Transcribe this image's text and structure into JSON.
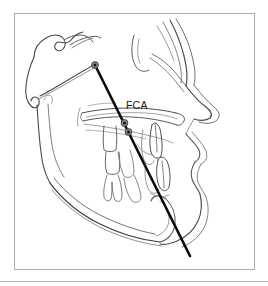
{
  "figure": {
    "domain": "cephalometric-tracing",
    "background_color": "#ffffff",
    "frame": {
      "name": "figure-border",
      "color": "#a9adb2",
      "x": 14,
      "y": 13,
      "width": 241,
      "height": 257
    },
    "bottom_rule": {
      "name": "bottom-divider",
      "color": "#b3b7bb",
      "y": 281
    }
  },
  "labels": [
    {
      "id": "fca",
      "text": "FCA",
      "x": 126,
      "y": 100,
      "color": "#1a1a1a",
      "font_size": 10.5
    }
  ],
  "measurement_line": {
    "name": "fca-line",
    "color": "#0b0b0b",
    "stroke_width": 2.6,
    "start": {
      "x": 95,
      "y": 65
    },
    "end": {
      "x": 190,
      "y": 256
    }
  },
  "landmark_points": [
    {
      "id": "point-superior",
      "x": 95,
      "y": 65,
      "outer_color": "#8a8a8a",
      "inner_color": "#111111",
      "outer_r": 3.4,
      "inner_r": 1.5
    },
    {
      "id": "point-middle",
      "x": 124.5,
      "y": 123,
      "outer_color": "#8a8a8a",
      "inner_color": "#111111",
      "outer_r": 3.4,
      "inner_r": 1.5
    },
    {
      "id": "point-inferior",
      "x": 128.5,
      "y": 132,
      "outer_color": "#8a8a8a",
      "inner_color": "#111111",
      "outer_r": 3.4,
      "inner_r": 1.5
    }
  ],
  "tracing_strokes": {
    "dark_color": "#3c3c3c",
    "mid_color": "#5e5e5e",
    "light_color": "#9a9a9a",
    "structures": [
      "posterior-cranial-base",
      "sella-turcica",
      "anterior-cranial-base",
      "orbital-rim",
      "frontal-bone-profile",
      "nasal-profile",
      "maxilla",
      "palatal-plane",
      "maxillary-molars",
      "maxillary-incisor",
      "mandibular-incisor",
      "mandibular-molars",
      "mandible-body",
      "mandible-ramus",
      "symphysis",
      "upper-lip-soft-tissue",
      "lower-lip-soft-tissue",
      "soft-tissue-chin"
    ]
  }
}
